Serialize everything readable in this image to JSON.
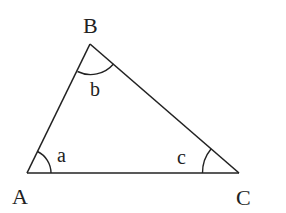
{
  "diagram": {
    "type": "triangle",
    "stroke_color": "#222222",
    "background": "#ffffff",
    "vertices": [
      {
        "id": "A",
        "label": "A",
        "x": 27,
        "y": 173
      },
      {
        "id": "B",
        "label": "B",
        "x": 90,
        "y": 44
      },
      {
        "id": "C",
        "label": "C",
        "x": 239,
        "y": 173
      }
    ],
    "angles": [
      {
        "at": "A",
        "label": "a"
      },
      {
        "at": "B",
        "label": "b"
      },
      {
        "at": "C",
        "label": "c"
      }
    ],
    "sides": [
      {
        "from": "A",
        "to": "B"
      },
      {
        "from": "B",
        "to": "C"
      },
      {
        "from": "C",
        "to": "A"
      }
    ]
  }
}
